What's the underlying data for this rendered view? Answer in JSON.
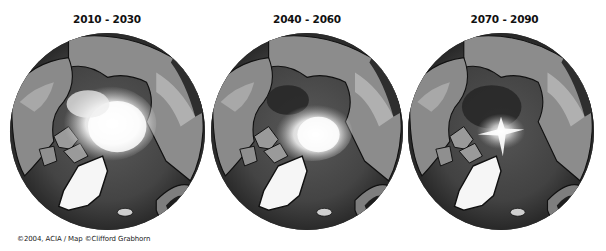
{
  "figure": {
    "panels": [
      {
        "title": "2010 - 2030",
        "ice_extent": "large",
        "ice_color": "#f4f4f4"
      },
      {
        "title": "2040 - 2060",
        "ice_extent": "medium",
        "ice_color": "#f0f0f0"
      },
      {
        "title": "2070 - 2090",
        "ice_extent": "small",
        "ice_color": "#ececec"
      }
    ],
    "credit": "©2004, ACIA / Map ©Clifford Grabhorn",
    "colors": {
      "background": "#ffffff",
      "ocean": "#4a4a4a",
      "deep_ocean": "#2e2e2e",
      "land": "#8a8a8a",
      "highland": "#b5b5b5",
      "coast": "#111111",
      "greenland_ice": "#f5f5f5",
      "title_text": "#111111"
    }
  }
}
